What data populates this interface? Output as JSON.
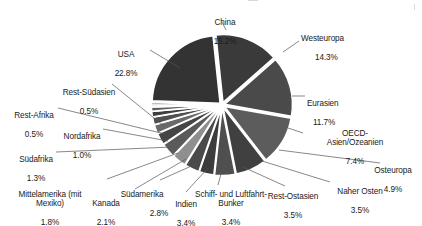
{
  "chart_data": {
    "type": "pie",
    "title": "",
    "subtitle": "",
    "xlabel": "",
    "ylabel": "",
    "legend_position": "none",
    "grid": false,
    "exploded": true,
    "value_unit": "%",
    "categories": [
      "China",
      "Westeuropa",
      "Eurasien",
      "OECD-Asien/Ozeanien",
      "Osteuropa",
      "Naher Osten",
      "Rest-Ostasien",
      "Schiff- und Luftfahrt-Bunker",
      "Indien",
      "Südamerika",
      "Kanada",
      "Mittelamerika (mit Mexiko)",
      "Südafrika",
      "Nordafrika",
      "Rest-Afrika",
      "Rest-Südasien",
      "USA"
    ],
    "values": [
      15.2,
      14.3,
      11.7,
      7.4,
      4.9,
      3.5,
      3.5,
      3.4,
      3.4,
      2.8,
      2.1,
      1.8,
      1.3,
      1.0,
      0.5,
      0.5,
      22.8
    ],
    "colors": [
      "#3a3a3a",
      "#4a4a4a",
      "#5c5c5c",
      "#404040",
      "#4f4f4f",
      "#3c3c3c",
      "#4a4a4a",
      "#8f8f8f",
      "#5a5a5a",
      "#454545",
      "#6a6a6a",
      "#505050",
      "#3e3e3e",
      "#5e5e5e",
      "#484848",
      "#7a7a7a",
      "#333333"
    ]
  },
  "labels": [
    {
      "name": "China",
      "pct": "15.2%"
    },
    {
      "name": "Westeuropa",
      "pct": "14.3%"
    },
    {
      "name": "Eurasien",
      "pct": "11.7%"
    },
    {
      "name": "OECD-\nAsien/Ozeanien",
      "pct": "7.4%"
    },
    {
      "name": "Osteuropa",
      "pct": "4.9%"
    },
    {
      "name": "Naher Osten",
      "pct": "3.5%"
    },
    {
      "name": "Rest-Ostasien",
      "pct": "3.5%"
    },
    {
      "name": "Schiff- und Luftfahrt-\nBunker",
      "pct": "3.4%"
    },
    {
      "name": "Indien",
      "pct": "3.4%"
    },
    {
      "name": "Südamerika",
      "pct": "2.8%"
    },
    {
      "name": "Kanada",
      "pct": "2.1%"
    },
    {
      "name": "Mittelamerika (mit\nMexiko)",
      "pct": "1.8%"
    },
    {
      "name": "Südafrika",
      "pct": "1.3%"
    },
    {
      "name": "Nordafrika",
      "pct": "1.0%"
    },
    {
      "name": "Rest-Afrika",
      "pct": "0.5%"
    },
    {
      "name": "Rest-Südasien",
      "pct": "0.5%"
    },
    {
      "name": "USA",
      "pct": "22.8%"
    }
  ]
}
